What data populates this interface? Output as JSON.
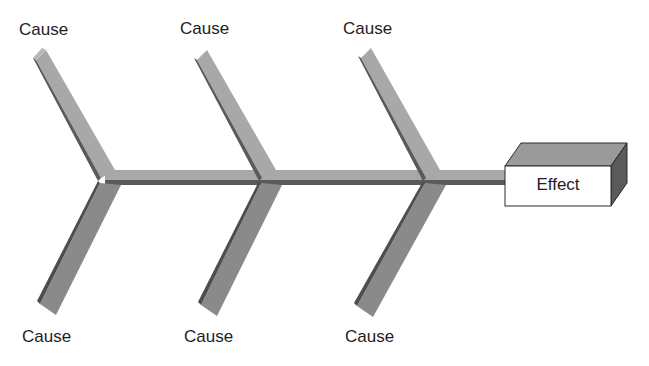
{
  "diagram": {
    "type": "fishbone",
    "causes_top": [
      {
        "label": "Cause"
      },
      {
        "label": "Cause"
      },
      {
        "label": "Cause"
      }
    ],
    "causes_bottom": [
      {
        "label": "Cause"
      },
      {
        "label": "Cause"
      },
      {
        "label": "Cause"
      }
    ],
    "effect": {
      "label": "Effect"
    },
    "colors": {
      "bone_light": "#a8a8a8",
      "bone_dark": "#5c5c5c",
      "bone_mid": "#8a8a8a",
      "box_face": "#ffffff",
      "box_top": "#9a9a9a",
      "box_side": "#5a5a5a",
      "outline": "#2a2a2a"
    }
  }
}
